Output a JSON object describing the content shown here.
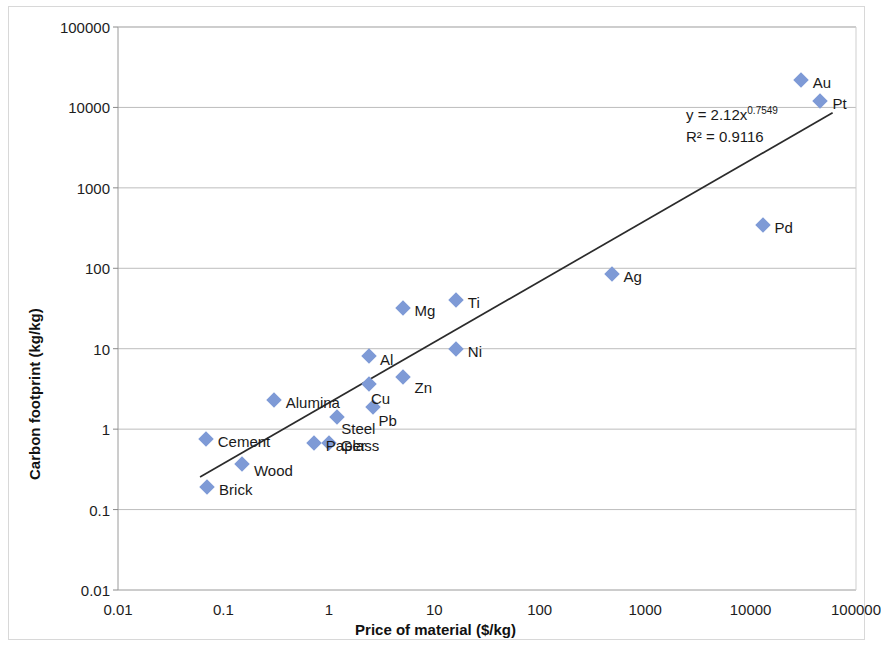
{
  "chart_data": {
    "type": "scatter",
    "title": "",
    "xlabel": "Price of material ($/kg)",
    "ylabel": "Carbon footprint (kg/kg)",
    "xscale": "log",
    "yscale": "log",
    "xlim": [
      0.01,
      100000
    ],
    "ylim": [
      0.01,
      100000
    ],
    "xticks": [
      "0.01",
      "0.1",
      "1",
      "10",
      "100",
      "1000",
      "10000",
      "100000"
    ],
    "yticks": [
      "0.01",
      "0.1",
      "1",
      "10",
      "100",
      "1000",
      "10000",
      "100000"
    ],
    "grid": "horizontal",
    "legend": "none",
    "marker_color": "#7e9ad6",
    "marker_shape": "diamond",
    "trendline": {
      "equation": "y = 2.12x",
      "exponent": "0.7549",
      "r_squared": "R² = 0.9116",
      "coefficient": 2.12,
      "power": 0.7549,
      "color": "#2b2b2b",
      "x_start": 0.06,
      "x_end": 60000
    },
    "points": [
      {
        "label": "Au",
        "x": 30000,
        "y": 22000
      },
      {
        "label": "Pt",
        "x": 46000,
        "y": 12000
      },
      {
        "label": "Pd",
        "x": 13000,
        "y": 350
      },
      {
        "label": "Ag",
        "x": 480,
        "y": 85
      },
      {
        "label": "Ti",
        "x": 16,
        "y": 40
      },
      {
        "label": "Mg",
        "x": 5.0,
        "y": 32
      },
      {
        "label": "Ni",
        "x": 16,
        "y": 10
      },
      {
        "label": "Al",
        "x": 2.4,
        "y": 8.2
      },
      {
        "label": "Zn",
        "x": 5.0,
        "y": 4.4
      },
      {
        "label": "Cu",
        "x": 2.4,
        "y": 3.6
      },
      {
        "label": "Pb",
        "x": 2.6,
        "y": 1.9
      },
      {
        "label": "Alumina",
        "x": 0.3,
        "y": 2.3
      },
      {
        "label": "Steel",
        "x": 1.2,
        "y": 1.4
      },
      {
        "label": "Cement",
        "x": 0.068,
        "y": 0.75
      },
      {
        "label": "Paper",
        "x": 0.72,
        "y": 0.68
      },
      {
        "label": "Glass",
        "x": 1.0,
        "y": 0.68
      },
      {
        "label": "Wood",
        "x": 0.15,
        "y": 0.37
      },
      {
        "label": "Brick",
        "x": 0.07,
        "y": 0.19
      }
    ]
  }
}
